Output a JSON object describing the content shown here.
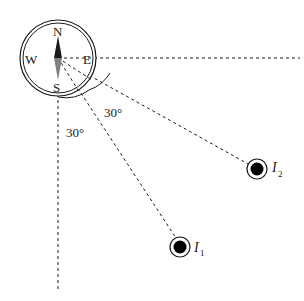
{
  "compass": {
    "north": "N",
    "south": "S",
    "east": "E",
    "west": "W"
  },
  "angles": {
    "angle_1": "30°",
    "angle_2": "30°"
  },
  "sources": {
    "source_1": {
      "label": "I",
      "subscript": "1"
    },
    "source_2": {
      "label": "I",
      "subscript": "2"
    }
  },
  "colors": {
    "line": "#1a1a1a",
    "needle_north": "#1a1a1a",
    "needle_south": "#808080"
  }
}
